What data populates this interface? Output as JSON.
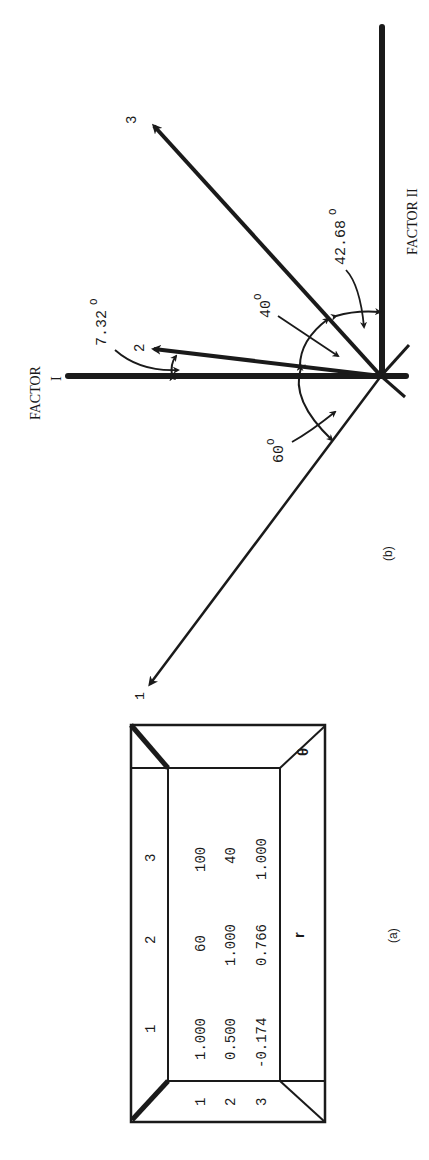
{
  "figure": {
    "orientation": "rotated 90 degrees counter-clockwise",
    "panel_a": {
      "label": "(a)",
      "column_headers": [
        "1",
        "2",
        "3"
      ],
      "row_headers": [
        "1",
        "2",
        "3"
      ],
      "rows": [
        [
          "1.000",
          "60",
          "100"
        ],
        [
          "0.500",
          "1.000",
          "40"
        ],
        [
          "-0.174",
          "0.766",
          "1.000"
        ]
      ],
      "upper_triangle_symbol": "θ",
      "lower_triangle_symbol": "r",
      "description": "Upper triangle: angles θ (degrees) between test vectors; lower triangle: correlations r = cos θ"
    },
    "panel_b": {
      "label": "(b)",
      "axes": {
        "factor_1": "FACTOR I",
        "factor_1_short": "FACTOR",
        "factor_1_numeral": "I",
        "factor_2": "FACTOR II"
      },
      "vectors": [
        {
          "label": "1"
        },
        {
          "label": "2"
        },
        {
          "label": "3"
        }
      ],
      "angles": {
        "v2_to_factor1": "7.32",
        "v1_to_v2": "60",
        "v2_to_v3": "40",
        "v3_to_factor2": "42.68",
        "degree_symbol": "O"
      }
    }
  },
  "colors": {
    "ink": "#1a1a1a",
    "background": "#ffffff"
  }
}
